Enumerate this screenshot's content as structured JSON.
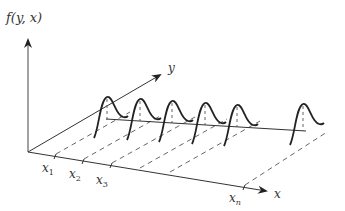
{
  "diagram": {
    "title": "",
    "axes": {
      "vertical_label": "f(y, x)",
      "depth_label": "y",
      "horizontal_label": "x"
    },
    "ticks": [
      {
        "base": "x",
        "sub": "1"
      },
      {
        "base": "x",
        "sub": "2"
      },
      {
        "base": "x",
        "sub": "3"
      },
      {
        "base": "x",
        "sub": "n"
      }
    ],
    "curves": {
      "count": 6,
      "shape": "gaussian",
      "description": "Gaussian density curves of y placed at successive x positions"
    },
    "colors": {
      "ink": "#222222",
      "dashed": "#555555",
      "background": "#ffffff"
    }
  }
}
